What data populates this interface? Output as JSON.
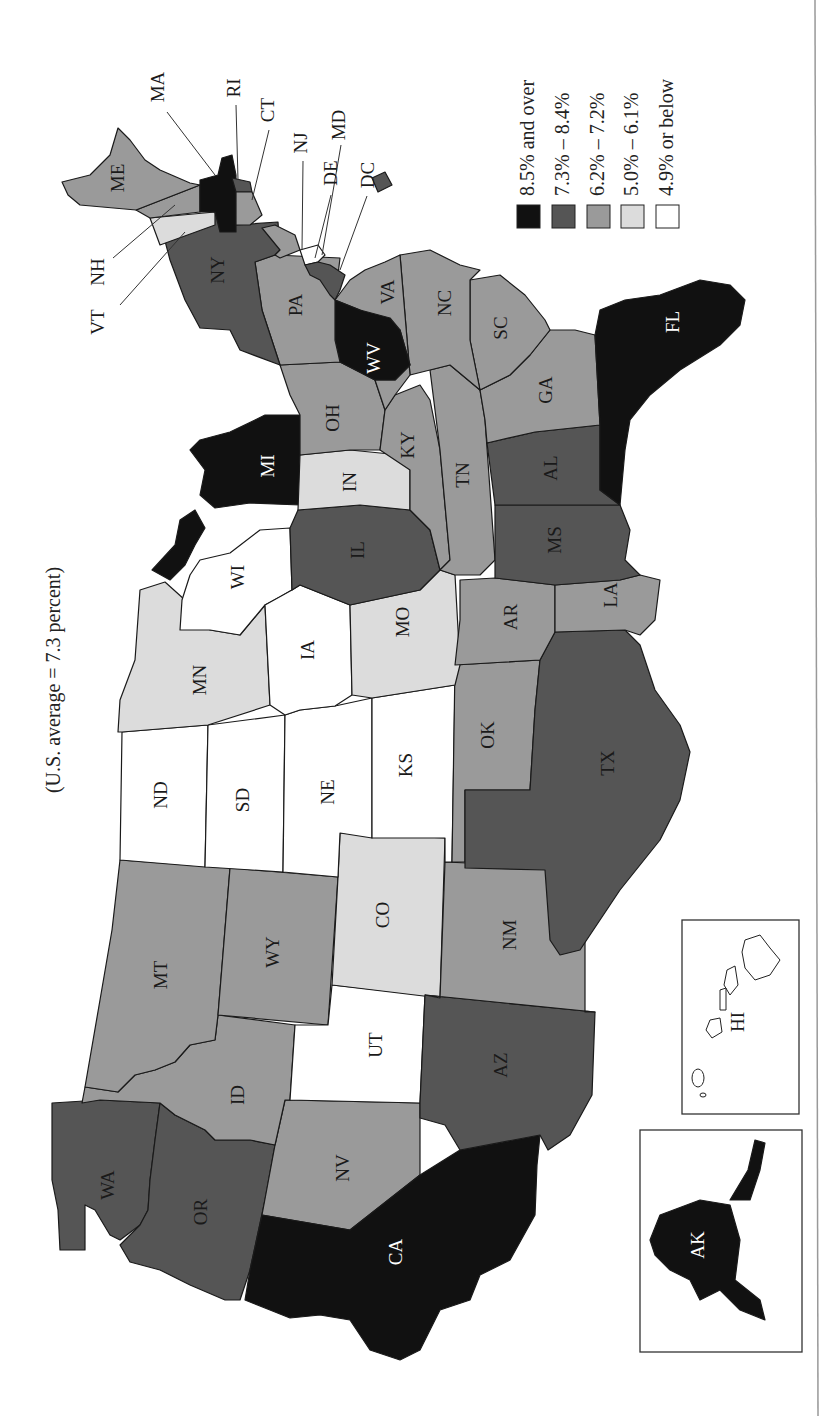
{
  "title": "(U.S. average = 7.3 percent)",
  "legend": {
    "items": [
      {
        "label": "8.5% and over",
        "color": "#111111",
        "class": "8.5+"
      },
      {
        "label": "7.3% – 8.4%",
        "color": "#555555",
        "class": "7.3-8.4"
      },
      {
        "label": "6.2% – 7.2%",
        "color": "#9a9a9a",
        "class": "6.2-7.2"
      },
      {
        "label": "5.0% – 6.1%",
        "color": "#dcdcdc",
        "class": "5.0-6.1"
      },
      {
        "label": "4.9% or below",
        "color": "#ffffff",
        "class": "<=4.9"
      }
    ]
  },
  "states": {
    "WA": {
      "label": "WA",
      "bin": "7.3-8.4"
    },
    "OR": {
      "label": "OR",
      "bin": "7.3-8.4"
    },
    "CA": {
      "label": "CA",
      "bin": "8.5+"
    },
    "NV": {
      "label": "NV",
      "bin": "6.2-7.2"
    },
    "ID": {
      "label": "ID",
      "bin": "6.2-7.2"
    },
    "MT": {
      "label": "MT",
      "bin": "6.2-7.2"
    },
    "WY": {
      "label": "WY",
      "bin": "6.2-7.2"
    },
    "UT": {
      "label": "UT",
      "bin": "<=4.9"
    },
    "AZ": {
      "label": "AZ",
      "bin": "7.3-8.4"
    },
    "CO": {
      "label": "CO",
      "bin": "5.0-6.1"
    },
    "NM": {
      "label": "NM",
      "bin": "6.2-7.2"
    },
    "ND": {
      "label": "ND",
      "bin": "<=4.9"
    },
    "SD": {
      "label": "SD",
      "bin": "<=4.9"
    },
    "NE": {
      "label": "NE",
      "bin": "<=4.9"
    },
    "KS": {
      "label": "KS",
      "bin": "<=4.9"
    },
    "OK": {
      "label": "OK",
      "bin": "6.2-7.2"
    },
    "TX": {
      "label": "TX",
      "bin": "7.3-8.4"
    },
    "MN": {
      "label": "MN",
      "bin": "5.0-6.1"
    },
    "IA": {
      "label": "IA",
      "bin": "<=4.9"
    },
    "MO": {
      "label": "MO",
      "bin": "5.0-6.1"
    },
    "AR": {
      "label": "AR",
      "bin": "6.2-7.2"
    },
    "LA": {
      "label": "LA",
      "bin": "6.2-7.2"
    },
    "WI": {
      "label": "WI",
      "bin": "<=4.9"
    },
    "IL": {
      "label": "IL",
      "bin": "7.3-8.4"
    },
    "MI": {
      "label": "MI",
      "bin": "8.5+"
    },
    "IN": {
      "label": "IN",
      "bin": "5.0-6.1"
    },
    "OH": {
      "label": "OH",
      "bin": "6.2-7.2"
    },
    "KY": {
      "label": "KY",
      "bin": "6.2-7.2"
    },
    "TN": {
      "label": "TN",
      "bin": "6.2-7.2"
    },
    "MS": {
      "label": "MS",
      "bin": "7.3-8.4"
    },
    "AL": {
      "label": "AL",
      "bin": "7.3-8.4"
    },
    "GA": {
      "label": "GA",
      "bin": "6.2-7.2"
    },
    "FL": {
      "label": "FL",
      "bin": "8.5+"
    },
    "SC": {
      "label": "SC",
      "bin": "6.2-7.2"
    },
    "NC": {
      "label": "NC",
      "bin": "6.2-7.2"
    },
    "VA": {
      "label": "VA",
      "bin": "6.2-7.2"
    },
    "WV": {
      "label": "WV",
      "bin": "8.5+"
    },
    "PA": {
      "label": "PA",
      "bin": "6.2-7.2"
    },
    "NY": {
      "label": "NY",
      "bin": "7.3-8.4"
    },
    "VT": {
      "label": "VT",
      "bin": "5.0-6.1"
    },
    "NH": {
      "label": "NH",
      "bin": "6.2-7.2"
    },
    "ME": {
      "label": "ME",
      "bin": "6.2-7.2"
    },
    "MA": {
      "label": "MA",
      "bin": "8.5+"
    },
    "RI": {
      "label": "RI",
      "bin": "7.3-8.4"
    },
    "CT": {
      "label": "CT",
      "bin": "6.2-7.2"
    },
    "NJ": {
      "label": "NJ",
      "bin": "6.2-7.2"
    },
    "DE": {
      "label": "DE",
      "bin": "<=4.9"
    },
    "MD": {
      "label": "MD",
      "bin": "7.3-8.4"
    },
    "DC": {
      "label": "DC",
      "bin": "7.3-8.4"
    },
    "AK": {
      "label": "AK",
      "bin": "8.5+"
    },
    "HI": {
      "label": "HI",
      "bin": "<=4.9"
    }
  }
}
